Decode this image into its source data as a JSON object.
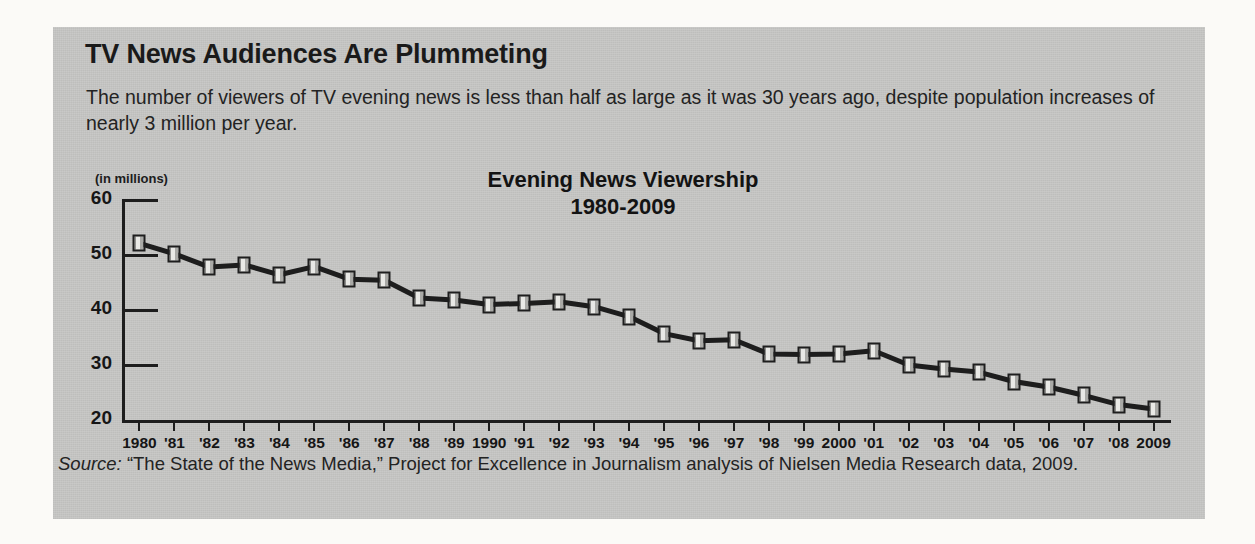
{
  "figure": {
    "headline": "TV News Audiences Are Plummeting",
    "deck": "The number of viewers of TV evening news is less than half as large as it was 30 years ago, despite population increases of nearly 3 million per year.",
    "source_prefix": "Source:",
    "source_text": " “The State of the News Media,” Project for Excellence in Journalism analysis of Nielsen Media Research data, 2009.",
    "panel_color": "#c8c8c6",
    "ink_color": "#1d1d1d"
  },
  "chart_data": {
    "type": "line",
    "title": "Evening News Viewership",
    "subtitle": "1980-2009",
    "units_label": "(in millions)",
    "xlabel": "",
    "ylabel": "(in millions)",
    "ylim": [
      20,
      60
    ],
    "yticks": [
      60,
      50,
      40,
      30,
      20
    ],
    "ytick_labels": [
      "60",
      "50",
      "40",
      "30",
      "20"
    ],
    "grid": true,
    "legend": "none",
    "categories": [
      "1980",
      "'81",
      "'82",
      "'83",
      "'84",
      "'85",
      "'86",
      "'87",
      "'88",
      "'89",
      "1990",
      "'91",
      "'92",
      "'93",
      "'94",
      "'95",
      "'96",
      "'97",
      "'98",
      "'99",
      "2000",
      "'01",
      "'02",
      "'03",
      "'04",
      "'05",
      "'06",
      "'07",
      "'08",
      "2009"
    ],
    "x": [
      1980,
      1981,
      1982,
      1983,
      1984,
      1985,
      1986,
      1987,
      1988,
      1989,
      1990,
      1991,
      1992,
      1993,
      1994,
      1995,
      1996,
      1997,
      1998,
      1999,
      2000,
      2001,
      2002,
      2003,
      2004,
      2005,
      2006,
      2007,
      2008,
      2009
    ],
    "values": [
      52.1,
      50.2,
      47.8,
      48.2,
      46.4,
      47.9,
      45.6,
      45.4,
      42.2,
      41.8,
      41.0,
      41.2,
      41.5,
      40.6,
      38.8,
      35.7,
      34.4,
      34.6,
      32.0,
      31.9,
      32.0,
      32.6,
      30.0,
      29.3,
      28.7,
      27.0,
      26.0,
      24.5,
      22.8,
      22.0
    ],
    "series": [
      {
        "name": "Evening news viewership (millions)",
        "values": [
          52.1,
          50.2,
          47.8,
          48.2,
          46.4,
          47.9,
          45.6,
          45.4,
          42.2,
          41.8,
          41.0,
          41.2,
          41.5,
          40.6,
          38.8,
          35.7,
          34.4,
          34.6,
          32.0,
          31.9,
          32.0,
          32.6,
          30.0,
          29.3,
          28.7,
          27.0,
          26.0,
          24.5,
          22.8,
          22.0
        ]
      }
    ]
  }
}
